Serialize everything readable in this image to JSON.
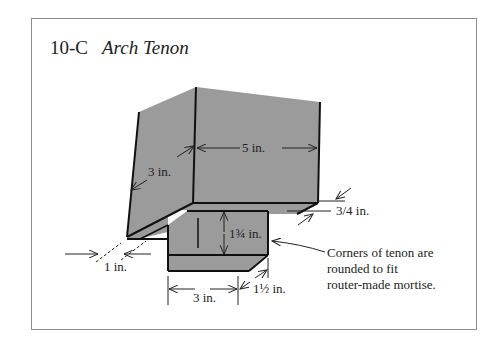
{
  "figure": {
    "label": "10-C",
    "title": "Arch Tenon"
  },
  "dimensions": {
    "block_width": "5 in.",
    "block_depth": "3 in.",
    "shoulder_offset": "3/4 in.",
    "shoulder_side": "1 in.",
    "tenon_height": "1¾ in.",
    "tenon_width": "3 in.",
    "tenon_depth": "1½ in."
  },
  "note": {
    "lines": [
      "Corners of tenon are",
      "rounded to fit",
      "router-made mortise."
    ]
  },
  "colors": {
    "face_fill": "#9b9b9b",
    "edge": "#111111",
    "frame": "#8c8c8c"
  }
}
